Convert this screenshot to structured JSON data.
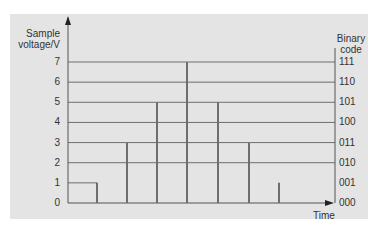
{
  "chart_data": {
    "type": "bar",
    "title": "",
    "xlabel": "Time",
    "ylabel": "Sample voltage/V",
    "ylabel_right": "Binary code",
    "ylim": [
      0,
      7
    ],
    "y_ticks": [
      0,
      1,
      2,
      3,
      4,
      5,
      6,
      7
    ],
    "y_ticks_right": [
      "000",
      "001",
      "010",
      "011",
      "100",
      "101",
      "110",
      "111"
    ],
    "grid": true,
    "categories": [
      "t1",
      "t2",
      "t3",
      "t4",
      "t5",
      "t6",
      "t7"
    ],
    "values": [
      1,
      3,
      5,
      7,
      5,
      3,
      1
    ],
    "bar_style": "thin vertical lines (sample pulses)"
  },
  "labels": {
    "ylabel_line1": "Sample",
    "ylabel_line2": "voltage/V",
    "ylabel_right_line1": "Binary",
    "ylabel_right_line2": "code",
    "xlabel": "Time"
  },
  "colors": {
    "panel": "#e4e4e4",
    "line": "#6e6e6e",
    "axis": "#555555",
    "text": "#333333"
  }
}
